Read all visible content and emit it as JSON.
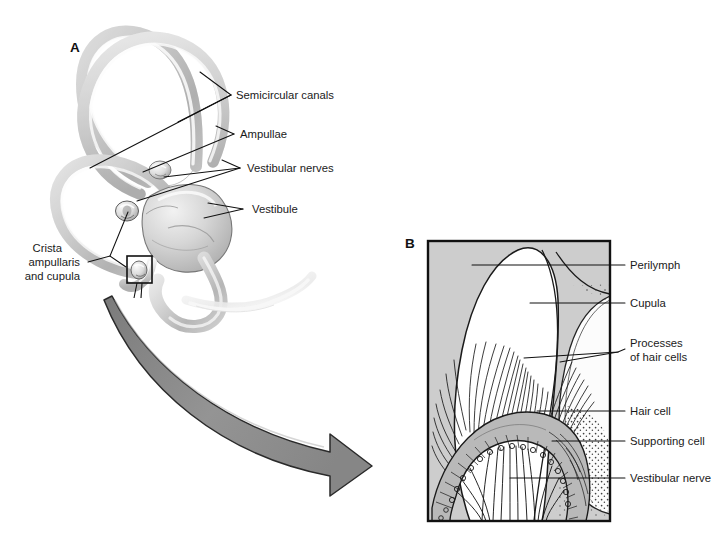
{
  "figure": {
    "background_color": "#ffffff",
    "panel_b_fill": "#cdcdcd",
    "ink_color": "#111111",
    "arrow_fill": "#8d8d8d"
  },
  "panels": [
    {
      "letter": "A",
      "caption": "Vestibular apparatus: semicircular canals and vestibule"
    },
    {
      "letter": "B",
      "caption": "Crista ampullaris and cupula, enlarged"
    }
  ],
  "panel_a": {
    "letter": "A",
    "labels": [
      {
        "id": "semicircular-canals",
        "text": "Semicircular canals"
      },
      {
        "id": "ampullae",
        "text": "Ampullae"
      },
      {
        "id": "vestibular-nerves",
        "text": "Vestibular nerves"
      },
      {
        "id": "vestibule",
        "text": "Vestibule"
      },
      {
        "id": "crista-ampullaris-line-1",
        "text": "Crista"
      },
      {
        "id": "crista-ampullaris-line-2",
        "text": "ampullaris"
      },
      {
        "id": "crista-ampullaris-line-3",
        "text": "and cupula"
      }
    ]
  },
  "panel_b": {
    "letter": "B",
    "labels": [
      {
        "id": "perilymph",
        "text": "Perilymph"
      },
      {
        "id": "cupula",
        "text": "Cupula"
      },
      {
        "id": "processes-of-hair-cells-line-1",
        "text": "Processes"
      },
      {
        "id": "processes-of-hair-cells-line-2",
        "text": "of hair cells"
      },
      {
        "id": "hair-cell",
        "text": "Hair cell"
      },
      {
        "id": "supporting-cell",
        "text": "Supporting cell"
      },
      {
        "id": "vestibular-nerve",
        "text": "Vestibular nerve"
      }
    ]
  },
  "connector": {
    "id": "magnification-arrow",
    "description": "curved gray arrow from boxed crista region in A to panel B"
  }
}
